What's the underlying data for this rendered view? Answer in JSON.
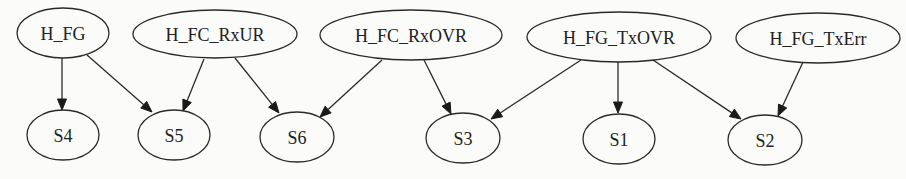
{
  "diagram": {
    "type": "directed-graph",
    "background": "#fbfbfa",
    "stroke_color": "#2a2a2a",
    "nodes": [
      {
        "id": "H_FG",
        "label": "H_FG",
        "cx": 63,
        "cy": 33,
        "rx": 46,
        "ry": 25,
        "row": "top"
      },
      {
        "id": "H_FC_RxUR",
        "label": "H_FC_RxUR",
        "cx": 215,
        "cy": 34,
        "rx": 82,
        "ry": 24,
        "row": "top"
      },
      {
        "id": "H_FC_RxOVR",
        "label": "H_FC_RxOVR",
        "cx": 411,
        "cy": 35,
        "rx": 91,
        "ry": 25,
        "row": "top"
      },
      {
        "id": "H_FG_TxOVR",
        "label": "H_FG_TxOVR",
        "cx": 619,
        "cy": 37,
        "rx": 92,
        "ry": 25,
        "row": "top"
      },
      {
        "id": "H_FG_TxErr",
        "label": "H_FG_TxErr",
        "cx": 818,
        "cy": 38,
        "rx": 82,
        "ry": 25,
        "row": "top"
      },
      {
        "id": "S4",
        "label": "S4",
        "cx": 63,
        "cy": 135,
        "rx": 36,
        "ry": 25,
        "row": "bottom"
      },
      {
        "id": "S5",
        "label": "S5",
        "cx": 174,
        "cy": 135,
        "rx": 36,
        "ry": 25,
        "row": "bottom"
      },
      {
        "id": "S6",
        "label": "S6",
        "cx": 297,
        "cy": 137,
        "rx": 37,
        "ry": 25,
        "row": "bottom"
      },
      {
        "id": "S3",
        "label": "S3",
        "cx": 463,
        "cy": 138,
        "rx": 37,
        "ry": 25,
        "row": "bottom"
      },
      {
        "id": "S1",
        "label": "S1",
        "cx": 619,
        "cy": 139,
        "rx": 36,
        "ry": 25,
        "row": "bottom"
      },
      {
        "id": "S2",
        "label": "S2",
        "cx": 765,
        "cy": 140,
        "rx": 37,
        "ry": 25,
        "row": "bottom"
      }
    ],
    "edges": [
      {
        "from": "H_FG",
        "to": "S4",
        "x1": 62,
        "y1": 58,
        "x2": 62,
        "y2": 110
      },
      {
        "from": "H_FG",
        "to": "S5",
        "x1": 87,
        "y1": 55,
        "x2": 152,
        "y2": 112
      },
      {
        "from": "H_FC_RxUR",
        "to": "S5",
        "x1": 204,
        "y1": 59,
        "x2": 183,
        "y2": 111
      },
      {
        "from": "H_FC_RxUR",
        "to": "S6",
        "x1": 235,
        "y1": 58,
        "x2": 279,
        "y2": 113
      },
      {
        "from": "H_FC_RxOVR",
        "to": "S6",
        "x1": 382,
        "y1": 60,
        "x2": 320,
        "y2": 117
      },
      {
        "from": "H_FC_RxOVR",
        "to": "S3",
        "x1": 424,
        "y1": 60,
        "x2": 451,
        "y2": 114
      },
      {
        "from": "H_FG_TxOVR",
        "to": "S3",
        "x1": 581,
        "y1": 60,
        "x2": 491,
        "y2": 119
      },
      {
        "from": "H_FG_TxOVR",
        "to": "S1",
        "x1": 618,
        "y1": 62,
        "x2": 618,
        "y2": 113
      },
      {
        "from": "H_FG_TxOVR",
        "to": "S2",
        "x1": 653,
        "y1": 60,
        "x2": 741,
        "y2": 119
      },
      {
        "from": "H_FG_TxErr",
        "to": "S2",
        "x1": 803,
        "y1": 62,
        "x2": 778,
        "y2": 116
      }
    ]
  }
}
